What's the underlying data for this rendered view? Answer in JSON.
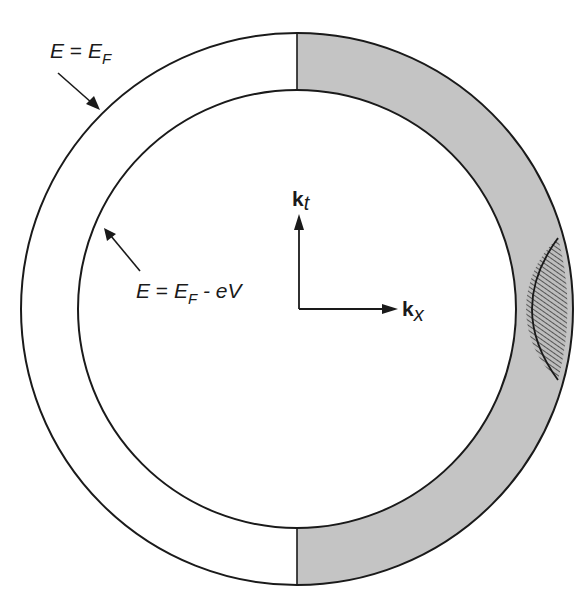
{
  "figure": {
    "type": "fermi-sphere-cross-section",
    "colors": {
      "background": "#ffffff",
      "stroke": "#1a1a1a",
      "shaded_half_shell": "#c4c4c4",
      "hatch_fill": "#bdbdbd",
      "hatch_line": "#3a3a3a"
    },
    "outer_circle_label": {
      "lhs": "E",
      "eq": " = ",
      "rhs_main": "E",
      "rhs_sub": "F"
    },
    "inner_circle_label": {
      "lhs": "E",
      "eq": " = ",
      "rhs_main": "E",
      "rhs_sub": "F",
      "rhs_tail": " - eV"
    },
    "axes": {
      "vertical": {
        "main": "k",
        "sub": "t"
      },
      "horizontal": {
        "main": "k",
        "sub": "x"
      }
    },
    "regions": [
      {
        "name": "outer-sphere",
        "description": "E = E_F"
      },
      {
        "name": "inner-sphere",
        "description": "E = E_F - eV"
      },
      {
        "name": "shaded-shell",
        "description": "right half of shell between spheres (k_x > 0)"
      },
      {
        "name": "hatched-lens",
        "description": "tunneling-allowed states near +k_x axis"
      }
    ]
  }
}
